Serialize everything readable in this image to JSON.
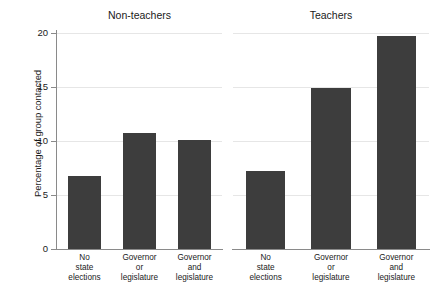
{
  "chart_data": {
    "type": "bar",
    "title": "",
    "xlabel": "",
    "ylabel": "Percentage of group contacted",
    "ylim": [
      0,
      20
    ],
    "yticks": [
      0,
      5,
      10,
      15,
      20
    ],
    "ytick_labels": [
      "0",
      "5",
      "10",
      "15",
      "20"
    ],
    "grid": true,
    "legend": "none",
    "categories": [
      "No state elections",
      "Governor or legislature",
      "Governor and legislature"
    ],
    "category_lines": [
      [
        "No",
        "state",
        "elections"
      ],
      [
        "Governor",
        "or",
        "legislature"
      ],
      [
        "Governor",
        "and",
        "legislature"
      ]
    ],
    "panels": [
      {
        "title": "Non-teachers",
        "values": [
          6.8,
          10.7,
          10.1
        ]
      },
      {
        "title": "Teachers",
        "values": [
          7.2,
          14.9,
          19.7
        ]
      }
    ],
    "series": [
      {
        "name": "Non-teachers",
        "values": [
          6.8,
          10.7,
          10.1
        ]
      },
      {
        "name": "Teachers",
        "values": [
          7.2,
          14.9,
          19.7
        ]
      }
    ],
    "colors": {
      "bar": "#3d3d3d",
      "grid": "#e6e6e6",
      "axis": "#8a8a8a",
      "background": "#ffffff",
      "text": "#1a1a1a"
    }
  }
}
